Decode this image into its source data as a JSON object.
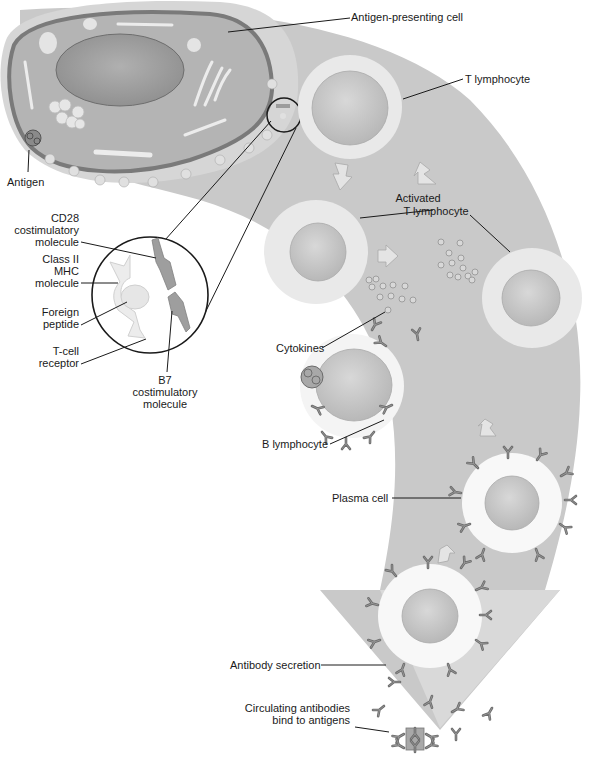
{
  "diagram": {
    "colors": {
      "background": "#ffffff",
      "flow_band": "#c9c9c9",
      "flow_band_light": "#dcdcdc",
      "apc_outer": "#d6d6d6",
      "apc_cytoplasm": "#b4b4b4",
      "apc_membrane": "#7a7a7a",
      "nucleus": "#9c9c9c",
      "cell_halo": "#eeeeee",
      "cell_nucleus": "#c4c4c4",
      "antibody": "#6b6b6b",
      "leader_line": "#1a1a1a"
    },
    "labels": {
      "apc": "Antigen-presenting cell",
      "t_lymphocyte": "T lymphocyte",
      "antigen": "Antigen",
      "activated_t_line1": "Activated",
      "activated_t_line2": "T lymphocyte",
      "cd28_line1": "CD28",
      "cd28_line2": "costimulatory",
      "cd28_line3": "molecule",
      "mhc_line1": "Class II",
      "mhc_line2": "MHC",
      "mhc_line3": "molecule",
      "peptide_line1": "Foreign",
      "peptide_line2": "peptide",
      "tcr_line1": "T-cell",
      "tcr_line2": "receptor",
      "b7_line1": "B7",
      "b7_line2": "costimulatory",
      "b7_line3": "molecule",
      "cytokines": "Cytokines",
      "b_lymphocyte": "B lymphocyte",
      "plasma_cell": "Plasma cell",
      "antibody_secretion": "Antibody secretion",
      "circulating_line1": "Circulating antibodies",
      "circulating_line2": "bind to antigens"
    },
    "stages": [
      "Antigen-presenting cell",
      "T lymphocyte",
      "Activated T lymphocyte",
      "Cytokines",
      "B lymphocyte",
      "Plasma cell",
      "Antibody secretion",
      "Circulating antibodies bind to antigens"
    ]
  }
}
